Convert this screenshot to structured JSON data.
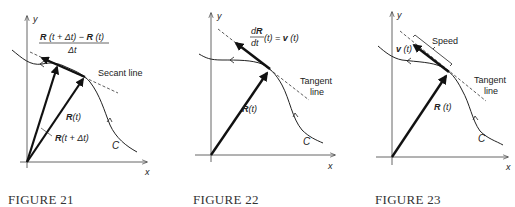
{
  "figures": [
    {
      "caption": "FIGURE 21",
      "axis_x_label": "x",
      "axis_y_label": "y",
      "curve_label": "C",
      "quotient_numerator_a": "R",
      "quotient_numerator_b": " (t + Δt) − ",
      "quotient_numerator_c": "R",
      "quotient_numerator_d": " (t)",
      "quotient_denominator": "Δt",
      "secant_label": "Secant line",
      "vector_1_bold": "R",
      "vector_1_rest": "(t)",
      "vector_2_bold": "R",
      "vector_2_rest": "(t + Δt)"
    },
    {
      "caption": "FIGURE 22",
      "axis_x_label": "x",
      "axis_y_label": "y",
      "curve_label": "C",
      "derivative_num_d": "d",
      "derivative_num_R": "R",
      "derivative_den": "dt",
      "derivative_rest_a": "(t) = ",
      "derivative_rest_b": "v",
      "derivative_rest_c": " (t)",
      "tangent_label_1": "Tangent",
      "tangent_label_2": "line",
      "vector_bold": "R",
      "vector_rest": "(t)"
    },
    {
      "caption": "FIGURE 23",
      "axis_x_label": "x",
      "axis_y_label": "y",
      "curve_label": "C",
      "velocity_bold": "v",
      "velocity_rest": " (t)",
      "speed_label": "Speed",
      "tangent_label_1": "Tangent",
      "tangent_label_2": "line",
      "vector_bold": "R",
      "vector_rest": " (t)"
    }
  ]
}
